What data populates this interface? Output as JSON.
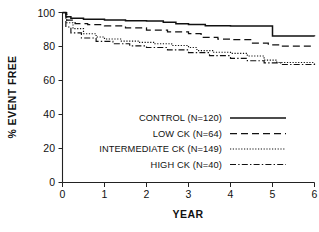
{
  "chart_data": {
    "type": "line",
    "title": "",
    "subtitle": "",
    "xlabel": "YEAR",
    "ylabel": "% EVENT FREE",
    "xlim": [
      0,
      6
    ],
    "ylim": [
      0,
      100
    ],
    "xticks": [
      "0",
      "1",
      "2",
      "3",
      "4",
      "5",
      "6"
    ],
    "yticks": [
      "0",
      "20",
      "40",
      "60",
      "80",
      "100"
    ],
    "grid": false,
    "legend_position": "center",
    "curve_style": "step",
    "series": [
      {
        "name": "CONTROL (N=120)",
        "label": "CONTROL (N=120)",
        "n": 120,
        "dash": "none",
        "points": [
          [
            0.0,
            100.0
          ],
          [
            0.08,
            97.5
          ],
          [
            0.2,
            96.6
          ],
          [
            0.5,
            96.0
          ],
          [
            1.0,
            95.6
          ],
          [
            1.5,
            95.2
          ],
          [
            2.0,
            95.0
          ],
          [
            2.4,
            94.2
          ],
          [
            2.7,
            93.4
          ],
          [
            3.0,
            93.0
          ],
          [
            3.4,
            92.2
          ],
          [
            4.0,
            92.0
          ],
          [
            4.9,
            92.0
          ],
          [
            5.0,
            86.2
          ],
          [
            6.0,
            86.0
          ]
        ]
      },
      {
        "name": "LOW CK (N=64)",
        "label": "LOW CK (N=64)",
        "n": 64,
        "dash": "dashed",
        "points": [
          [
            0.0,
            100.0
          ],
          [
            0.1,
            95.5
          ],
          [
            0.3,
            93.5
          ],
          [
            0.6,
            92.8
          ],
          [
            1.0,
            92.2
          ],
          [
            1.5,
            91.0
          ],
          [
            2.0,
            89.6
          ],
          [
            2.5,
            88.6
          ],
          [
            3.0,
            87.6
          ],
          [
            3.3,
            85.4
          ],
          [
            3.7,
            84.4
          ],
          [
            4.0,
            84.0
          ],
          [
            4.5,
            82.0
          ],
          [
            4.9,
            81.0
          ],
          [
            5.2,
            80.2
          ],
          [
            6.0,
            80.0
          ]
        ]
      },
      {
        "name": "INTERMEDIATE CK (N=149)",
        "label": "INTERMEDIATE CK (N=149)",
        "n": 149,
        "dash": "dotted",
        "points": [
          [
            0.0,
            100.0
          ],
          [
            0.1,
            94.0
          ],
          [
            0.25,
            90.5
          ],
          [
            0.5,
            87.5
          ],
          [
            0.8,
            85.6
          ],
          [
            1.0,
            84.4
          ],
          [
            1.4,
            83.2
          ],
          [
            1.8,
            82.4
          ],
          [
            2.2,
            81.6
          ],
          [
            2.6,
            80.6
          ],
          [
            3.0,
            79.4
          ],
          [
            3.2,
            77.6
          ],
          [
            3.6,
            76.6
          ],
          [
            4.0,
            76.0
          ],
          [
            4.4,
            74.4
          ],
          [
            4.8,
            72.0
          ],
          [
            5.1,
            70.6
          ],
          [
            6.0,
            70.0
          ]
        ]
      },
      {
        "name": "HIGH CK (N=40)",
        "label": "HIGH CK (N=40)",
        "n": 40,
        "dash": "dashdot",
        "points": [
          [
            0.0,
            100.0
          ],
          [
            0.08,
            91.5
          ],
          [
            0.2,
            88.0
          ],
          [
            0.45,
            85.0
          ],
          [
            0.8,
            83.0
          ],
          [
            1.2,
            81.6
          ],
          [
            1.6,
            80.4
          ],
          [
            2.0,
            79.4
          ],
          [
            2.5,
            78.0
          ],
          [
            3.0,
            76.4
          ],
          [
            3.5,
            74.6
          ],
          [
            4.0,
            73.0
          ],
          [
            4.4,
            71.6
          ],
          [
            4.8,
            70.4
          ],
          [
            5.2,
            69.4
          ],
          [
            6.0,
            69.0
          ]
        ]
      }
    ]
  },
  "legend": {
    "entries": [
      {
        "label": "CONTROL (N=120)",
        "dash": "none"
      },
      {
        "label": "LOW CK (N=64)",
        "dash": "dashed"
      },
      {
        "label": "INTERMEDIATE CK (N=149)",
        "dash": "dotted"
      },
      {
        "label": "HIGH CK (N=40)",
        "dash": "dashdot"
      }
    ]
  },
  "colors": {
    "line": "#111111",
    "axis": "#222222",
    "background": "#ffffff"
  }
}
